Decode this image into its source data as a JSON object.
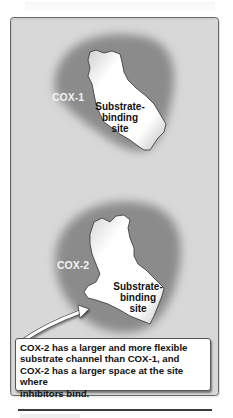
{
  "figure": {
    "panels": [
      {
        "label": "COX-1",
        "site_label_lines": [
          "Substrate-",
          "binding",
          "site"
        ]
      },
      {
        "label": "COX-2",
        "site_label_lines": [
          "Substrate-",
          "binding",
          "site"
        ]
      }
    ],
    "callout": {
      "lines": [
        "COX-2 has a larger and more flexible",
        "substrate channel than COX-1, and",
        "COX-2 has a larger space at the site where",
        "inhibitors bind."
      ]
    },
    "colors": {
      "panel_background": "#d6d6d6",
      "protein_shade": "#8a8a8a",
      "site_fill": "#ffffff",
      "label_text": "#f2f2f2",
      "border": "#6d6d6d"
    }
  }
}
